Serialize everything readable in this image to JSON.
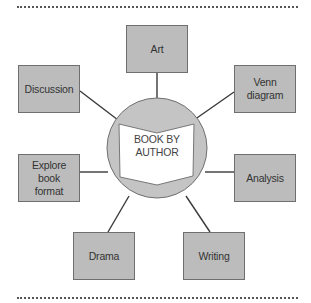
{
  "diagram": {
    "type": "hub-and-spoke",
    "center": {
      "label": "BOOK BY AUTHOR",
      "icon": "open-book-icon"
    },
    "nodes": [
      {
        "id": "art",
        "label": "Art"
      },
      {
        "id": "venn",
        "label": "Venn diagram"
      },
      {
        "id": "analysis",
        "label": "Analysis"
      },
      {
        "id": "writing",
        "label": "Writing"
      },
      {
        "id": "drama",
        "label": "Drama"
      },
      {
        "id": "explore",
        "label": "Explore book format"
      },
      {
        "id": "discussion",
        "label": "Discussion"
      }
    ],
    "colors": {
      "box_fill": "#bcbcbc",
      "box_border": "#6f6f6f",
      "circle_fill": "#c4c4c4",
      "connector": "#3a3a3a",
      "book_fill": "#ffffff"
    }
  }
}
